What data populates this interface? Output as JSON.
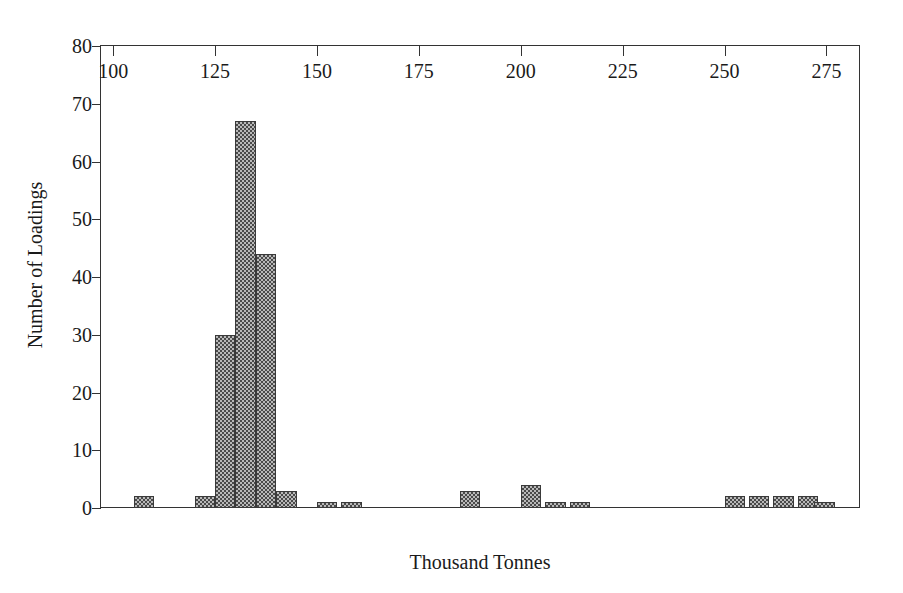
{
  "chart_data": {
    "type": "bar",
    "title": "",
    "subtitle": "",
    "xlabel": "Thousand Tonnes",
    "ylabel": "Number of Loadings",
    "xlim": [
      97,
      283
    ],
    "ylim": [
      0,
      80
    ],
    "xticks": [
      100,
      125,
      150,
      175,
      200,
      225,
      250,
      275
    ],
    "yticks": [
      0,
      10,
      20,
      30,
      40,
      50,
      60,
      70,
      80
    ],
    "grid": false,
    "legend": null,
    "bin_width": 5,
    "bar_fill": "checkerboard-hatch",
    "bar_color": "#b9b9b9",
    "bar_edge_color": "#3a3a3a",
    "axis_color": "#333333",
    "background": "#ffffff",
    "bins": [
      {
        "x_left": 105,
        "x_right": 110,
        "value": 2
      },
      {
        "x_left": 120,
        "x_right": 125,
        "value": 2
      },
      {
        "x_left": 125,
        "x_right": 130,
        "value": 30
      },
      {
        "x_left": 130,
        "x_right": 135,
        "value": 67
      },
      {
        "x_left": 135,
        "x_right": 140,
        "value": 44
      },
      {
        "x_left": 140,
        "x_right": 145,
        "value": 3
      },
      {
        "x_left": 150,
        "x_right": 155,
        "value": 1
      },
      {
        "x_left": 156,
        "x_right": 161,
        "value": 1
      },
      {
        "x_left": 185,
        "x_right": 190,
        "value": 3
      },
      {
        "x_left": 200,
        "x_right": 205,
        "value": 4
      },
      {
        "x_left": 206,
        "x_right": 211,
        "value": 1
      },
      {
        "x_left": 212,
        "x_right": 217,
        "value": 1
      },
      {
        "x_left": 250,
        "x_right": 255,
        "value": 2
      },
      {
        "x_left": 256,
        "x_right": 261,
        "value": 2
      },
      {
        "x_left": 262,
        "x_right": 267,
        "value": 2
      },
      {
        "x_left": 268,
        "x_right": 273,
        "value": 2
      },
      {
        "x_left": 272,
        "x_right": 277,
        "value": 1
      }
    ],
    "categories": [
      "105",
      "120",
      "125",
      "130",
      "135",
      "140",
      "150",
      "156",
      "185",
      "200",
      "206",
      "212",
      "250",
      "256",
      "262",
      "268",
      "272"
    ],
    "values": [
      2,
      2,
      30,
      67,
      44,
      3,
      1,
      1,
      3,
      4,
      1,
      1,
      2,
      2,
      2,
      2,
      1
    ]
  }
}
